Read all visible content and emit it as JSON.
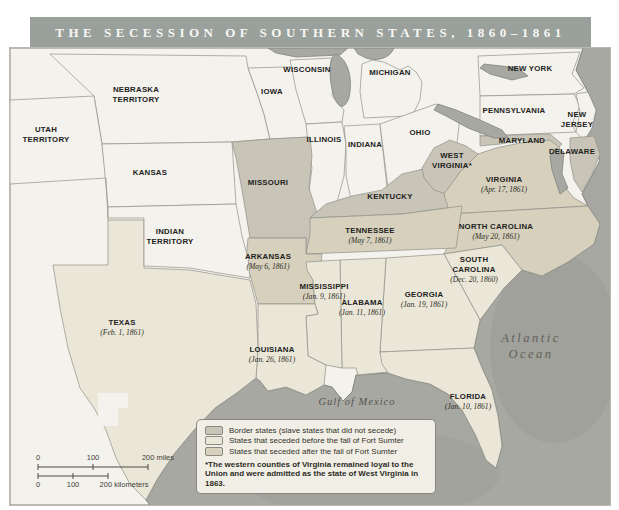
{
  "title": "THE SECESSION OF SOUTHERN STATES, 1860–1861",
  "map": {
    "palette": {
      "union": "#f4f2ec",
      "border": "#c8c5b8",
      "before": "#ebe7d8",
      "after": "#d6d0bd",
      "water": "#a8a8a3"
    },
    "states": [
      {
        "id": "utah-territory",
        "name_lines": [
          "UTAH",
          "TERRITORY"
        ],
        "category": "union",
        "label": {
          "x": 36,
          "y": 84
        }
      },
      {
        "id": "nebraska-territory",
        "name_lines": [
          "NEBRASKA",
          "TERRITORY"
        ],
        "category": "union",
        "label": {
          "x": 126,
          "y": 44
        }
      },
      {
        "id": "iowa",
        "name_lines": [
          "IOWA"
        ],
        "category": "union",
        "label": {
          "x": 262,
          "y": 46
        }
      },
      {
        "id": "kansas",
        "name_lines": [
          "KANSAS"
        ],
        "category": "union",
        "label": {
          "x": 140,
          "y": 127
        }
      },
      {
        "id": "wisconsin",
        "name_lines": [
          "WISCONSIN"
        ],
        "category": "union",
        "label": {
          "x": 297,
          "y": 24
        }
      },
      {
        "id": "michigan",
        "name_lines": [
          "MICHIGAN"
        ],
        "category": "union",
        "label": {
          "x": 380,
          "y": 27
        }
      },
      {
        "id": "illinois",
        "name_lines": [
          "ILLINOIS"
        ],
        "category": "union",
        "label": {
          "x": 314,
          "y": 94
        }
      },
      {
        "id": "indiana",
        "name_lines": [
          "INDIANA"
        ],
        "category": "union",
        "label": {
          "x": 355,
          "y": 99
        }
      },
      {
        "id": "ohio",
        "name_lines": [
          "OHIO"
        ],
        "category": "union",
        "label": {
          "x": 410,
          "y": 87
        }
      },
      {
        "id": "new-york",
        "name_lines": [
          "NEW YORK"
        ],
        "category": "union",
        "label": {
          "x": 520,
          "y": 23
        }
      },
      {
        "id": "pennsylvania",
        "name_lines": [
          "PENNSYLVANIA"
        ],
        "category": "union",
        "label": {
          "x": 504,
          "y": 65
        }
      },
      {
        "id": "new-jersey",
        "name_lines": [
          "NEW",
          "JERSEY"
        ],
        "category": "union",
        "label": {
          "x": 567,
          "y": 69
        }
      },
      {
        "id": "indian-territory",
        "name_lines": [
          "INDIAN",
          "TERRITORY"
        ],
        "category": "union",
        "label": {
          "x": 160,
          "y": 186
        }
      },
      {
        "id": "missouri",
        "name_lines": [
          "MISSOURI"
        ],
        "category": "border",
        "label": {
          "x": 258,
          "y": 137
        }
      },
      {
        "id": "kentucky",
        "name_lines": [
          "KENTUCKY"
        ],
        "category": "border",
        "label": {
          "x": 380,
          "y": 151
        }
      },
      {
        "id": "west-virginia",
        "name_lines": [
          "WEST",
          "VIRGINIA*"
        ],
        "category": "border",
        "label": {
          "x": 442,
          "y": 110
        }
      },
      {
        "id": "maryland",
        "name_lines": [
          "MARYLAND"
        ],
        "category": "border",
        "label": {
          "x": 512,
          "y": 95
        }
      },
      {
        "id": "delaware",
        "name_lines": [
          "DELAWARE"
        ],
        "category": "border",
        "label": {
          "x": 562,
          "y": 106
        }
      },
      {
        "id": "virginia",
        "name_lines": [
          "VIRGINIA"
        ],
        "category": "after",
        "date": "(Apr. 17, 1861)",
        "label": {
          "x": 494,
          "y": 134
        }
      },
      {
        "id": "north-carolina",
        "name_lines": [
          "NORTH CAROLINA"
        ],
        "category": "after",
        "date": "(May 20, 1861)",
        "label": {
          "x": 486,
          "y": 181
        }
      },
      {
        "id": "tennessee",
        "name_lines": [
          "TENNESSEE"
        ],
        "category": "after",
        "date": "(May 7, 1861)",
        "label": {
          "x": 360,
          "y": 185
        }
      },
      {
        "id": "arkansas",
        "name_lines": [
          "ARKANSAS"
        ],
        "category": "after",
        "date": "(May 6, 1861)",
        "label": {
          "x": 258,
          "y": 211
        }
      },
      {
        "id": "south-carolina",
        "name_lines": [
          "SOUTH",
          "CAROLINA"
        ],
        "category": "before",
        "date": "(Dec. 20, 1860)",
        "label": {
          "x": 464,
          "y": 214
        }
      },
      {
        "id": "georgia",
        "name_lines": [
          "GEORGIA"
        ],
        "category": "before",
        "date": "(Jan. 19, 1861)",
        "label": {
          "x": 414,
          "y": 249
        }
      },
      {
        "id": "alabama",
        "name_lines": [
          "ALABAMA"
        ],
        "category": "before",
        "date": "(Jan. 11, 1861)",
        "label": {
          "x": 352,
          "y": 257
        }
      },
      {
        "id": "mississippi",
        "name_lines": [
          "MISSISSIPPI"
        ],
        "category": "before",
        "date": "(Jan. 9, 1861)",
        "label": {
          "x": 314,
          "y": 241
        }
      },
      {
        "id": "louisiana",
        "name_lines": [
          "LOUISIANA"
        ],
        "category": "before",
        "date": "(Jan. 26, 1861)",
        "label": {
          "x": 262,
          "y": 304
        }
      },
      {
        "id": "texas",
        "name_lines": [
          "TEXAS"
        ],
        "category": "before",
        "date": "(Feb. 1, 1861)",
        "label": {
          "x": 112,
          "y": 277
        }
      },
      {
        "id": "florida",
        "name_lines": [
          "FLORIDA"
        ],
        "category": "before",
        "date": "(Jan. 10, 1861)",
        "label": {
          "x": 458,
          "y": 351
        }
      }
    ],
    "water_labels": [
      {
        "id": "atlantic-ocean",
        "lines": [
          "Atlantic",
          "Ocean"
        ],
        "x": 521,
        "y": 294,
        "line_height": 16,
        "cls": "ocean-label"
      },
      {
        "id": "gulf-of-mexico",
        "lines": [
          "Gulf of Mexico"
        ],
        "x": 347,
        "y": 357,
        "line_height": 12,
        "cls": "gulf-label"
      }
    ],
    "scale": {
      "miles_labels": [
        "0",
        "100",
        "200 miles"
      ],
      "km_labels": [
        "0",
        "100",
        "200 kilometers"
      ]
    }
  },
  "legend": {
    "items": [
      {
        "label": "Border states (slave states that did not secede)",
        "swatch": "#c8c5b8"
      },
      {
        "label": "States that seceded before the fall of Fort Sumter",
        "swatch": "#ebe7d8"
      },
      {
        "label": "States that seceded after the fall of Fort Sumter",
        "swatch": "#d6d0bd"
      }
    ],
    "footnote": "*The western counties of Virginia remained loyal to the Union and were admitted as the state of West Virginia in 1863."
  }
}
